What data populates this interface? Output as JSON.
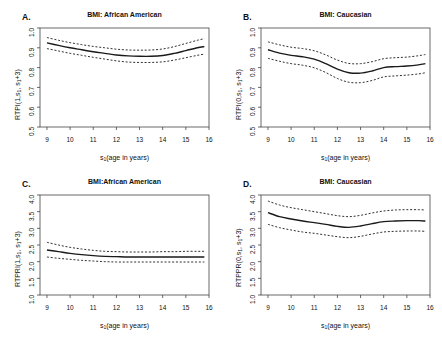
{
  "figure": {
    "cut_off_header_text": "                       ",
    "background": "#ffffff",
    "line_color": "#1a1a1a",
    "axis_color": "#444444"
  },
  "panels": [
    {
      "letter": "A.",
      "title": "BMI: African American",
      "ylabel_parts": {
        "pre": "RTPI(1,s",
        "sub1": "1",
        "mid": ", s",
        "sub2": "1",
        "post": "+3)"
      },
      "xlabel_parts": {
        "pre": "s",
        "sub": "1",
        "post": "(age in years)"
      }
    },
    {
      "letter": "B.",
      "title": "BMI: Caucasian",
      "ylabel_parts": {
        "pre": "RTPI(0,s",
        "sub1": "1",
        "mid": ", s",
        "sub2": "1",
        "post": "+3)"
      },
      "xlabel_parts": {
        "pre": "s",
        "sub": "1",
        "post": "(age in years)"
      }
    },
    {
      "letter": "C.",
      "title": "BMI:African American",
      "ylabel_parts": {
        "pre": "RTPRI(1,s",
        "sub1": "1",
        "mid": ", s",
        "sub2": "1",
        "post": "+3)"
      },
      "xlabel_parts": {
        "pre": "s",
        "sub": "1",
        "post": "(age in years)"
      }
    },
    {
      "letter": "D.",
      "title": "BMI: Caucasian",
      "ylabel_parts": {
        "pre": "RTPPR(0,s",
        "sub1": "1",
        "mid": ", s",
        "sub2": "1",
        "post": "+3)"
      },
      "xlabel_parts": {
        "pre": "s",
        "sub": "1",
        "post": "(age in years)"
      }
    }
  ],
  "chart_data": [
    {
      "id": "A",
      "type": "line",
      "title": "BMI: African American",
      "panel_letter": "A.",
      "xlabel": "s1(age in years)",
      "ylabel": "RTPI(1,s1, s1+3)",
      "xlim": [
        8.7,
        16.0
      ],
      "ylim": [
        0.5,
        1.0
      ],
      "xticks": [
        9,
        10,
        11,
        12,
        13,
        14,
        15,
        16
      ],
      "yticks": [
        0.5,
        0.6,
        0.7,
        0.8,
        0.9,
        1.0
      ],
      "grid": false,
      "legend": "none",
      "x": [
        9.0,
        9.5,
        10.0,
        10.5,
        11.0,
        11.5,
        12.0,
        12.5,
        13.0,
        13.5,
        14.0,
        14.5,
        15.0,
        15.5,
        15.8
      ],
      "series": [
        {
          "name": "estimate",
          "style": "solid",
          "values": [
            0.925,
            0.912,
            0.9,
            0.89,
            0.88,
            0.872,
            0.864,
            0.859,
            0.857,
            0.857,
            0.861,
            0.872,
            0.886,
            0.9,
            0.906
          ]
        },
        {
          "name": "upper 95% CI",
          "style": "dashed",
          "values": [
            0.952,
            0.938,
            0.926,
            0.916,
            0.907,
            0.9,
            0.893,
            0.889,
            0.888,
            0.889,
            0.894,
            0.906,
            0.922,
            0.938,
            0.946
          ]
        },
        {
          "name": "lower 95% CI",
          "style": "dashed",
          "values": [
            0.896,
            0.884,
            0.872,
            0.862,
            0.852,
            0.843,
            0.834,
            0.828,
            0.826,
            0.826,
            0.829,
            0.838,
            0.85,
            0.862,
            0.868
          ]
        }
      ]
    },
    {
      "id": "B",
      "type": "line",
      "title": "BMI: Caucasian",
      "panel_letter": "B.",
      "xlabel": "s1(age in years)",
      "ylabel": "RTPI(0,s1, s1+3)",
      "xlim": [
        8.7,
        16.0
      ],
      "ylim": [
        0.5,
        1.0
      ],
      "xticks": [
        9,
        10,
        11,
        12,
        13,
        14,
        15,
        16
      ],
      "yticks": [
        0.5,
        0.6,
        0.7,
        0.8,
        0.9,
        1.0
      ],
      "grid": false,
      "legend": "none",
      "x": [
        9.0,
        9.5,
        10.0,
        10.5,
        11.0,
        11.5,
        12.0,
        12.5,
        13.0,
        13.5,
        14.0,
        14.5,
        15.0,
        15.5,
        15.8
      ],
      "series": [
        {
          "name": "estimate",
          "style": "solid",
          "values": [
            0.89,
            0.873,
            0.862,
            0.855,
            0.843,
            0.82,
            0.792,
            0.774,
            0.772,
            0.783,
            0.8,
            0.805,
            0.808,
            0.814,
            0.82
          ]
        },
        {
          "name": "upper 95% CI",
          "style": "dashed",
          "values": [
            0.93,
            0.915,
            0.903,
            0.896,
            0.885,
            0.864,
            0.838,
            0.821,
            0.82,
            0.83,
            0.845,
            0.85,
            0.853,
            0.86,
            0.866
          ]
        },
        {
          "name": "lower 95% CI",
          "style": "dashed",
          "values": [
            0.847,
            0.832,
            0.82,
            0.812,
            0.799,
            0.775,
            0.745,
            0.726,
            0.724,
            0.735,
            0.753,
            0.758,
            0.762,
            0.768,
            0.774
          ]
        }
      ]
    },
    {
      "id": "C",
      "type": "line",
      "title": "BMI:African American",
      "panel_letter": "C.",
      "xlabel": "s1(age in years)",
      "ylabel": "RTPRI(1,s1, s1+3)",
      "xlim": [
        8.7,
        16.0
      ],
      "ylim": [
        1.0,
        4.0
      ],
      "xticks": [
        9,
        10,
        11,
        12,
        13,
        14,
        15,
        16
      ],
      "yticks": [
        1.0,
        1.5,
        2.0,
        2.5,
        3.0,
        3.5,
        4.0
      ],
      "grid": false,
      "legend": "none",
      "x": [
        9.0,
        9.5,
        10.0,
        10.5,
        11.0,
        11.5,
        12.0,
        12.5,
        13.0,
        13.5,
        14.0,
        14.5,
        15.0,
        15.5,
        15.8
      ],
      "series": [
        {
          "name": "estimate",
          "style": "solid",
          "values": [
            2.35,
            2.3,
            2.25,
            2.21,
            2.18,
            2.16,
            2.15,
            2.14,
            2.14,
            2.14,
            2.14,
            2.14,
            2.14,
            2.14,
            2.14
          ]
        },
        {
          "name": "upper 95% CI",
          "style": "dashed",
          "values": [
            2.58,
            2.5,
            2.43,
            2.38,
            2.34,
            2.31,
            2.3,
            2.29,
            2.29,
            2.29,
            2.3,
            2.3,
            2.31,
            2.31,
            2.31
          ]
        },
        {
          "name": "lower 95% CI",
          "style": "dashed",
          "values": [
            2.14,
            2.1,
            2.07,
            2.04,
            2.02,
            2.0,
            1.99,
            1.99,
            1.99,
            1.99,
            1.99,
            1.99,
            1.99,
            1.99,
            1.99
          ]
        }
      ]
    },
    {
      "id": "D",
      "type": "line",
      "title": "BMI: Caucasian",
      "panel_letter": "D.",
      "xlabel": "s1(age in years)",
      "ylabel": "RTPPR(0,s1, s1+3)",
      "xlim": [
        8.7,
        16.0
      ],
      "ylim": [
        1.0,
        4.0
      ],
      "xticks": [
        9,
        10,
        11,
        12,
        13,
        14,
        15,
        16
      ],
      "yticks": [
        1.0,
        1.5,
        2.0,
        2.5,
        3.0,
        3.5,
        4.0
      ],
      "grid": false,
      "legend": "none",
      "x": [
        9.0,
        9.5,
        10.0,
        10.5,
        11.0,
        11.5,
        12.0,
        12.5,
        13.0,
        13.5,
        14.0,
        14.5,
        15.0,
        15.5,
        15.8
      ],
      "series": [
        {
          "name": "estimate",
          "style": "solid",
          "values": [
            3.47,
            3.35,
            3.28,
            3.22,
            3.17,
            3.12,
            3.06,
            3.03,
            3.07,
            3.14,
            3.2,
            3.22,
            3.23,
            3.23,
            3.22
          ]
        },
        {
          "name": "upper 95% CI",
          "style": "dashed",
          "values": [
            3.82,
            3.7,
            3.62,
            3.56,
            3.5,
            3.44,
            3.38,
            3.35,
            3.39,
            3.46,
            3.52,
            3.55,
            3.56,
            3.56,
            3.55
          ]
        },
        {
          "name": "lower 95% CI",
          "style": "dashed",
          "values": [
            3.12,
            3.02,
            2.95,
            2.89,
            2.85,
            2.8,
            2.75,
            2.72,
            2.76,
            2.83,
            2.89,
            2.91,
            2.92,
            2.92,
            2.91
          ]
        }
      ]
    }
  ]
}
